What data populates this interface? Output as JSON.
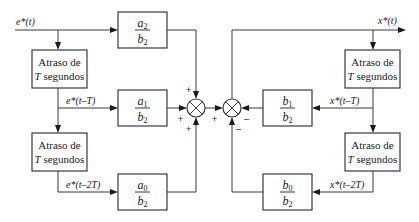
{
  "diagram": {
    "type": "block-diagram",
    "signals": {
      "input": "e*(t)",
      "input_delay1": "e*(t–T)",
      "input_delay2": "e*(t–2T)",
      "output": "x*(t)",
      "output_delay1": "x*(t–T)",
      "output_delay2": "x*(t–2T)"
    },
    "delay_block": {
      "line1": "Atraso de",
      "line2_var": "T",
      "line2_rest": " segundos"
    },
    "gains": [
      {
        "id": "a2",
        "num": "a",
        "num_sub": "2",
        "den": "b",
        "den_sub": "2"
      },
      {
        "id": "a1",
        "num": "a",
        "num_sub": "1",
        "den": "b",
        "den_sub": "2"
      },
      {
        "id": "a0",
        "num": "a",
        "num_sub": "0",
        "den": "b",
        "den_sub": "2"
      },
      {
        "id": "b1",
        "num": "b",
        "num_sub": "1",
        "den": "b",
        "den_sub": "2"
      },
      {
        "id": "b0",
        "num": "b",
        "num_sub": "0",
        "den": "b",
        "den_sub": "2"
      }
    ],
    "summing_junction_1": {
      "top": "+",
      "left": "+",
      "bottom": "+"
    },
    "summing_junction_2": {
      "left": "+",
      "right": "–",
      "bottom": "–"
    },
    "colors": {
      "stroke": "#3a3a3a",
      "text": "#1a1a1a",
      "background": "#ffffff"
    }
  }
}
